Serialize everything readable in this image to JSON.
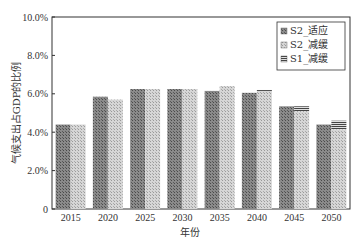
{
  "chart_data": {
    "type": "bar",
    "title": "",
    "xlabel": "年份",
    "ylabel": "气候支出占GDP的比例",
    "ylim": [
      0,
      10
    ],
    "yticks": [
      "0",
      "2.0%",
      "4.0%",
      "6.0%",
      "8.0%",
      "10.0%"
    ],
    "categories": [
      "2015",
      "2020",
      "2025",
      "2030",
      "2035",
      "2040",
      "2045",
      "2050"
    ],
    "series": [
      {
        "name": "S2_适应",
        "values": [
          4.4,
          5.85,
          6.25,
          6.25,
          6.15,
          6.05,
          5.35,
          4.4
        ],
        "color": "#7a7a7a"
      },
      {
        "name": "S2_减缓",
        "values": [
          4.4,
          5.7,
          6.25,
          6.25,
          6.4,
          6.15,
          5.1,
          4.15
        ],
        "color": "#c8c8c8"
      },
      {
        "name": "S1_减缓",
        "values": [
          0,
          0,
          0,
          0,
          0,
          0.05,
          0.25,
          0.45
        ],
        "color": "#555555",
        "stacked_on": "S2_减缓"
      }
    ],
    "legend_position": "top-right",
    "grid": false
  }
}
